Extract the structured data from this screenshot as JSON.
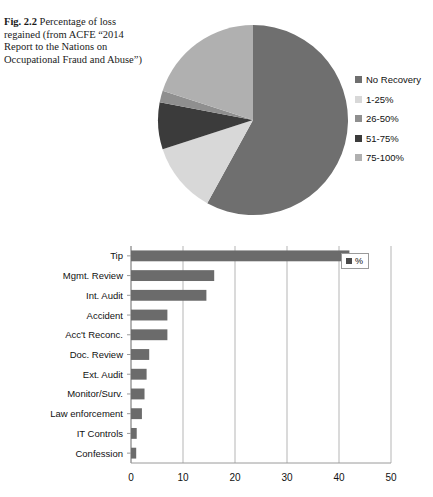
{
  "caption": {
    "figure_number": "Fig. 2.2",
    "text": "Percentage of loss regained (from ACFE “2014 Report to the Nations on Occupational Fraud and Abuse”)"
  },
  "colors": {
    "no_recovery": "#6f6f6f",
    "p1_25": "#d8d8d8",
    "p26_50": "#8f8f8f",
    "p51_75": "#3b3b3b",
    "p75_100": "#b0b0b0",
    "bar_fill": "#6b6b6b",
    "axis": "#9a9a9a",
    "gridline": "#b5b5b5",
    "legend_marker": "#4a4a4a"
  },
  "chart_data": [
    {
      "type": "pie",
      "title": "",
      "legend_position": "right",
      "categories": [
        "No Recovery",
        "1-25%",
        "26-50%",
        "51-75%",
        "75-100%"
      ],
      "values": [
        58,
        12,
        8,
        2,
        20
      ],
      "unit": "%",
      "slice_colors": [
        "#6f6f6f",
        "#d8d8d8",
        "#3b3b3b",
        "#8f8f8f",
        "#b0b0b0"
      ],
      "legend": [
        {
          "label": "No Recovery",
          "color": "#6f6f6f"
        },
        {
          "label": "1-25%",
          "color": "#d8d8d8"
        },
        {
          "label": "26-50%",
          "color": "#8f8f8f"
        },
        {
          "label": "51-75%",
          "color": "#3b3b3b"
        },
        {
          "label": "75-100%",
          "color": "#b0b0b0"
        }
      ]
    },
    {
      "type": "bar",
      "orientation": "horizontal",
      "title": "",
      "xlabel": "",
      "ylabel": "",
      "xlim": [
        0,
        50
      ],
      "xticks": [
        0,
        10,
        20,
        30,
        40,
        50
      ],
      "grid": true,
      "legend": [
        {
          "label": "%",
          "color": "#4a4a4a"
        }
      ],
      "legend_position": "top-right",
      "categories": [
        "Confession",
        "IT Controls",
        "Law enforcement",
        "Monitor/Surv.",
        "Ext. Audit",
        "Doc. Review",
        "Acc't Reconc.",
        "Accident",
        "Int. Audit",
        "Mgmt. Review",
        "Tip"
      ],
      "values": [
        1,
        1.1,
        2.1,
        2.6,
        3,
        3.5,
        7,
        7,
        14.5,
        16,
        42
      ]
    }
  ]
}
